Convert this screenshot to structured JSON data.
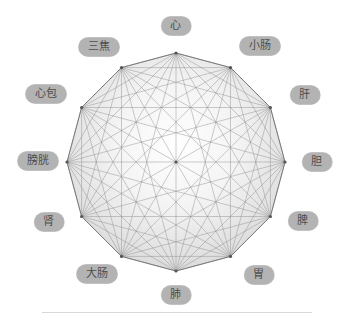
{
  "diagram": {
    "type": "complete-graph-dodecagon",
    "title": "",
    "center": {
      "x": 176,
      "y": 162
    },
    "radius": 109,
    "label_radius": 148,
    "vertex_count": 12,
    "colors": {
      "pill_bg": "#b3b3b3",
      "pill_text": "#4d4d4d",
      "edge": "#8f8f8f",
      "outline": "#7a7a7a",
      "fill_inner": "#fefefe",
      "fill_outer": "#dcdcdc",
      "rule": "#d9d9d9",
      "background": "#ffffff"
    },
    "nodes": [
      {
        "label": "心",
        "name": "heart",
        "angle": -90,
        "label_x": 176,
        "label_y": 26
      },
      {
        "label": "小肠",
        "name": "small-intestine",
        "angle": -60,
        "label_x": 260,
        "label_y": 46
      },
      {
        "label": "肝",
        "name": "liver",
        "angle": -30,
        "label_x": 305,
        "label_y": 95
      },
      {
        "label": "胆",
        "name": "gallbladder",
        "angle": 0,
        "label_x": 317,
        "label_y": 162
      },
      {
        "label": "脾",
        "name": "spleen",
        "angle": 30,
        "label_x": 303,
        "label_y": 221
      },
      {
        "label": "胃",
        "name": "stomach",
        "angle": 60,
        "label_x": 259,
        "label_y": 275
      },
      {
        "label": "肺",
        "name": "lung",
        "angle": 90,
        "label_x": 176,
        "label_y": 295
      },
      {
        "label": "大肠",
        "name": "large-intestine",
        "angle": 120,
        "label_x": 97,
        "label_y": 274
      },
      {
        "label": "肾",
        "name": "kidney",
        "angle": 150,
        "label_x": 49,
        "label_y": 222
      },
      {
        "label": "膀胱",
        "name": "bladder",
        "angle": 180,
        "label_x": 38,
        "label_y": 161
      },
      {
        "label": "心包",
        "name": "pericardium",
        "angle": -150,
        "label_x": 46,
        "label_y": 94
      },
      {
        "label": "三焦",
        "name": "triple-burner",
        "angle": -120,
        "label_x": 99,
        "label_y": 47
      }
    ]
  }
}
